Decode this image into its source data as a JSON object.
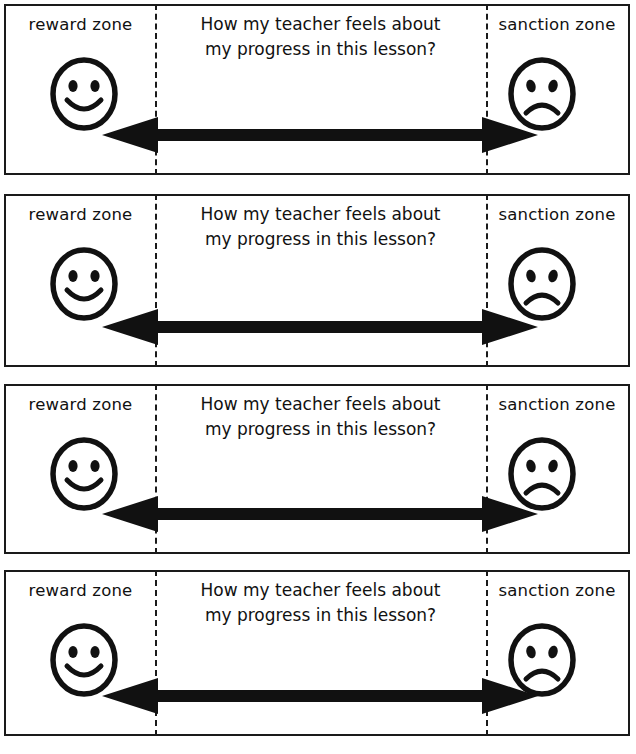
{
  "document": {
    "title": "How my teacher feels about my progress in this lesson?",
    "kind": "worksheet-strips",
    "panel_count": 4,
    "colors": {
      "ink": "#1a1a1a",
      "text": "#111111",
      "background": "#ffffff"
    }
  },
  "panel_template": {
    "left_zone": {
      "label": "reward zone",
      "icon": "smiley-face-happy"
    },
    "center": {
      "question_line_1": "How my teacher feels about",
      "question_line_2": "my progress in this lesson?"
    },
    "right_zone": {
      "label": "sanction zone",
      "icon": "smiley-face-sad"
    },
    "scale": {
      "icon": "double-headed-arrow",
      "direction": "bidirectional",
      "left_end": "reward zone",
      "right_end": "sanction zone"
    }
  },
  "panels": [
    {
      "index": 1,
      "left_label": "reward zone",
      "question_line_1": "How my teacher feels about",
      "question_line_2": "my progress in this lesson?",
      "right_label": "sanction zone"
    },
    {
      "index": 2,
      "left_label": "reward zone",
      "question_line_1": "How my teacher feels about",
      "question_line_2": "my progress in this lesson?",
      "right_label": "sanction zone"
    },
    {
      "index": 3,
      "left_label": "reward zone",
      "question_line_1": "How my teacher feels about",
      "question_line_2": "my progress in this lesson?",
      "right_label": "sanction zone"
    },
    {
      "index": 4,
      "left_label": "reward zone",
      "question_line_1": "How my teacher feels about",
      "question_line_2": "my progress in this lesson?",
      "right_label": "sanction zone"
    }
  ]
}
